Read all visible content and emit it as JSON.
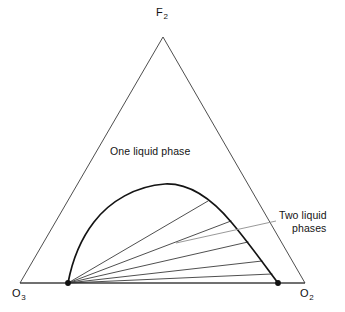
{
  "figure": {
    "kind": "ternary-phase-diagram",
    "background_color": "#ffffff",
    "line_color": "#2b2b2b",
    "curve_color": "#111111",
    "leader_color": "#8d8d8d",
    "marker_color": "#111111"
  },
  "vertices": {
    "apex": {
      "symbol": "F",
      "subscript": "2"
    },
    "bottom_left": {
      "symbol": "O",
      "subscript": "3"
    },
    "bottom_right": {
      "symbol": "O",
      "subscript": "2"
    }
  },
  "regions": {
    "one_phase_label": "One liquid phase",
    "two_phase_label_line1": "Two liquid",
    "two_phase_label_line2": "phases"
  },
  "chart_data": {
    "type": "scatter",
    "title": "",
    "xlabel": "",
    "ylabel": "",
    "components": [
      "F2",
      "O3",
      "O2"
    ],
    "triangle": {
      "apex": [
        163,
        37
      ],
      "bottom_left": [
        20,
        283
      ],
      "bottom_right": [
        305,
        283
      ]
    },
    "binodal_curve": {
      "label": "Two liquid phases",
      "left_end": [
        68,
        283
      ],
      "right_end": [
        278,
        283
      ],
      "peak": [
        165,
        184
      ],
      "points": [
        [
          68,
          283
        ],
        [
          74,
          268
        ],
        [
          81,
          253
        ],
        [
          89,
          239
        ],
        [
          98,
          226
        ],
        [
          108,
          214
        ],
        [
          119,
          204
        ],
        [
          131,
          195
        ],
        [
          144,
          189
        ],
        [
          155,
          185
        ],
        [
          165,
          184
        ],
        [
          178,
          186
        ],
        [
          191,
          191
        ],
        [
          205,
          199
        ],
        [
          218,
          209
        ],
        [
          231,
          221
        ],
        [
          243,
          235
        ],
        [
          254,
          249
        ],
        [
          264,
          263
        ],
        [
          271,
          273
        ],
        [
          278,
          283
        ]
      ]
    },
    "end_markers": [
      {
        "x": 68,
        "y": 283
      },
      {
        "x": 278,
        "y": 283
      }
    ],
    "tie_lines": [
      {
        "from": [
          68,
          283
        ],
        "to": [
          208,
          201
        ]
      },
      {
        "from": [
          68,
          283
        ],
        "to": [
          231,
          221
        ]
      },
      {
        "from": [
          68,
          283
        ],
        "to": [
          248,
          242
        ]
      },
      {
        "from": [
          68,
          283
        ],
        "to": [
          262,
          261
        ]
      },
      {
        "from": [
          68,
          283
        ],
        "to": [
          272,
          274
        ]
      }
    ],
    "leader_line": {
      "from": [
        176,
        243
      ],
      "to": [
        276,
        221
      ]
    },
    "grid": false,
    "legend": "none"
  }
}
